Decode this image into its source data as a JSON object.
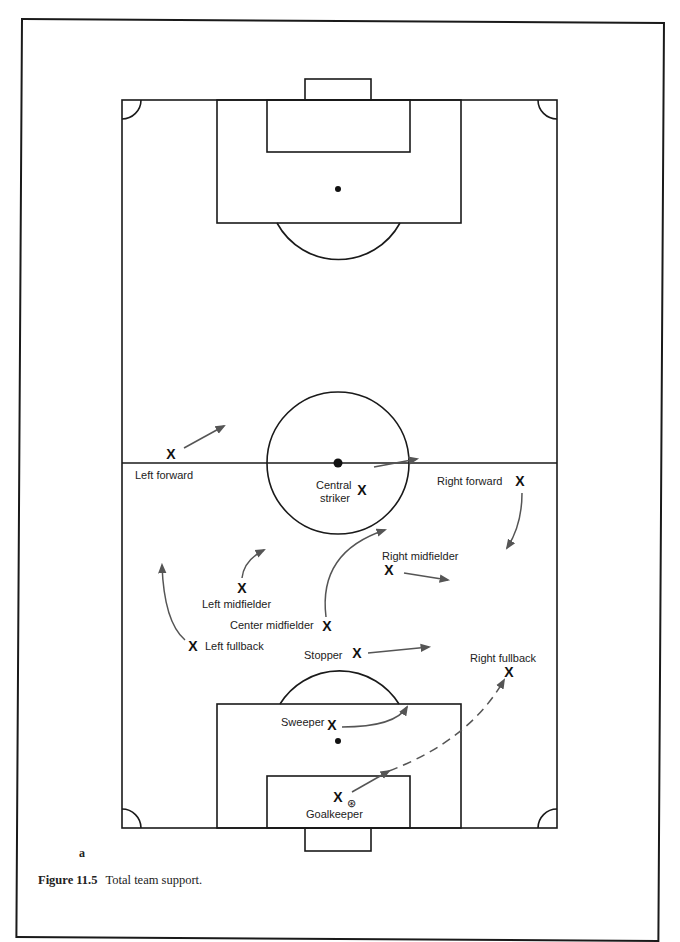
{
  "figure": {
    "number": "Figure 11.5",
    "caption": "Total team support.",
    "panel_letter": "a"
  },
  "colors": {
    "line": "#1a1a1a",
    "arrow": "#555555",
    "text": "#222222"
  },
  "players": {
    "left_forward": {
      "label": "Left forward",
      "marker": "X"
    },
    "central_striker": {
      "label_line1": "Central",
      "label_line2": "striker",
      "marker": "X"
    },
    "right_forward": {
      "label": "Right forward",
      "marker": "X"
    },
    "right_midfielder": {
      "label": "Right midfielder",
      "marker": "X"
    },
    "left_midfielder": {
      "label": "Left midfielder",
      "marker": "X"
    },
    "center_midfielder": {
      "label": "Center midfielder",
      "marker": "X"
    },
    "left_fullback": {
      "label": "Left fullback",
      "marker": "X"
    },
    "stopper": {
      "label": "Stopper",
      "marker": "X"
    },
    "right_fullback": {
      "label": "Right fullback",
      "marker": "X"
    },
    "sweeper": {
      "label": "Sweeper",
      "marker": "X"
    },
    "goalkeeper": {
      "label": "Goalkeeper",
      "marker": "X",
      "ball": "⊛"
    }
  }
}
